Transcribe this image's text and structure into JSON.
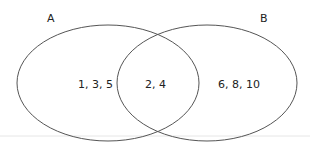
{
  "diagram": {
    "type": "venn",
    "sets": [
      {
        "label": "A",
        "only_elements": "1, 3, 5"
      },
      {
        "label": "B",
        "only_elements": "6, 8, 10"
      }
    ],
    "intersection": {
      "elements": "2, 4"
    },
    "colors": {
      "stroke": "#555555",
      "background": "#ffffff",
      "text": "#222222"
    }
  }
}
